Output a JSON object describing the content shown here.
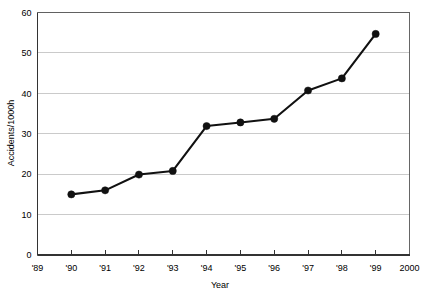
{
  "chart_data": {
    "type": "line",
    "title": "",
    "subtitle": "",
    "xlabel": "Year",
    "ylabel": "Accidents/1000h",
    "xlim": [
      1989,
      2000
    ],
    "ylim": [
      0,
      60
    ],
    "ytick_step": 10,
    "grid": "horizontal",
    "legend": "none",
    "marker": "filled-circle",
    "line_color": "#111111",
    "marker_color": "#111111",
    "grid_color": "#b3b3b3",
    "frame_color": "#555555",
    "background": "#ffffff",
    "xtick_labels": [
      "'89",
      "'90",
      "'91",
      "'92",
      "'93",
      "'94",
      "'95",
      "'96",
      "'97",
      "'98",
      "'99",
      "2000"
    ],
    "xtick_values": [
      1989,
      1990,
      1991,
      1992,
      1993,
      1994,
      1995,
      1996,
      1997,
      1998,
      1999,
      2000
    ],
    "ytick_labels": [
      "0",
      "10",
      "20",
      "30",
      "40",
      "50",
      "60"
    ],
    "ytick_values": [
      0,
      10,
      20,
      30,
      40,
      50,
      60
    ],
    "x": [
      1990,
      1991,
      1992,
      1993,
      1994,
      1995,
      1996,
      1997,
      1998,
      1999
    ],
    "categories": [
      "'90",
      "'91",
      "'92",
      "'93",
      "'94",
      "'95",
      "'96",
      "'97",
      "'98",
      "'99"
    ],
    "values": [
      15.0,
      16.0,
      19.9,
      20.8,
      31.9,
      32.8,
      33.7,
      40.7,
      43.7,
      54.7
    ],
    "series": [
      {
        "name": "Accidents/1000h",
        "values": [
          15.0,
          16.0,
          19.9,
          20.8,
          31.9,
          32.8,
          33.7,
          40.7,
          43.7,
          54.7
        ]
      }
    ],
    "annotations": []
  }
}
